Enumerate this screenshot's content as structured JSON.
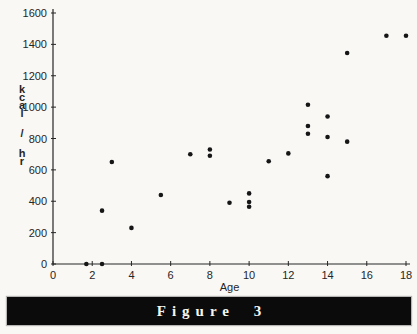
{
  "figure": {
    "caption": "Figure 3"
  },
  "colors": {
    "ink": "#262626",
    "point": "#161616",
    "banner_background": "#0b0b0b",
    "banner_text": "#f7f6f0",
    "paper_background": "#f9f8f5"
  },
  "chart_data": {
    "type": "scatter",
    "title": "",
    "xlabel": "Age",
    "ylabel": "kcal / hr",
    "xlim": [
      0,
      18
    ],
    "ylim": [
      0,
      1600
    ],
    "xticks": [
      0,
      2,
      4,
      6,
      8,
      10,
      12,
      14,
      16,
      18
    ],
    "yticks": [
      0,
      200,
      400,
      600,
      800,
      1000,
      1200,
      1400,
      1600
    ],
    "grid": false,
    "legend": null,
    "marker": "filled-circle",
    "point_color": "#161616",
    "points": [
      {
        "age": 1.7,
        "kcal_per_hr": 0
      },
      {
        "age": 2.5,
        "kcal_per_hr": 0
      },
      {
        "age": 2.5,
        "kcal_per_hr": 340
      },
      {
        "age": 3,
        "kcal_per_hr": 650
      },
      {
        "age": 4,
        "kcal_per_hr": 230
      },
      {
        "age": 5.5,
        "kcal_per_hr": 440
      },
      {
        "age": 7,
        "kcal_per_hr": 700
      },
      {
        "age": 8,
        "kcal_per_hr": 730
      },
      {
        "age": 8,
        "kcal_per_hr": 690
      },
      {
        "age": 9,
        "kcal_per_hr": 390
      },
      {
        "age": 10,
        "kcal_per_hr": 450
      },
      {
        "age": 10,
        "kcal_per_hr": 395
      },
      {
        "age": 10,
        "kcal_per_hr": 365
      },
      {
        "age": 11,
        "kcal_per_hr": 655
      },
      {
        "age": 12,
        "kcal_per_hr": 705
      },
      {
        "age": 13,
        "kcal_per_hr": 1015
      },
      {
        "age": 13,
        "kcal_per_hr": 880
      },
      {
        "age": 13,
        "kcal_per_hr": 830
      },
      {
        "age": 14,
        "kcal_per_hr": 940
      },
      {
        "age": 14,
        "kcal_per_hr": 810
      },
      {
        "age": 14,
        "kcal_per_hr": 560
      },
      {
        "age": 15,
        "kcal_per_hr": 1345
      },
      {
        "age": 15,
        "kcal_per_hr": 780
      },
      {
        "age": 17,
        "kcal_per_hr": 1455
      },
      {
        "age": 18,
        "kcal_per_hr": 1455
      }
    ]
  }
}
